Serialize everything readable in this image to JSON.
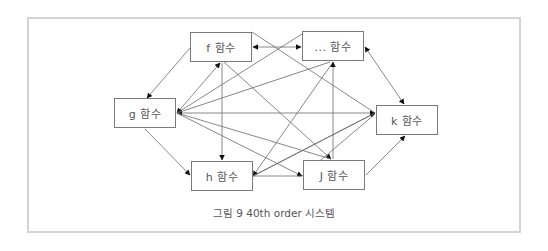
{
  "figure": {
    "caption": "그림 9 40th  order  시스템",
    "nodes": {
      "f": {
        "label": "f  함수"
      },
      "dots": {
        "label": "...  함수"
      },
      "g": {
        "label": "g  함수"
      },
      "k": {
        "label": "k  함수"
      },
      "h": {
        "label": "h  함수"
      },
      "j": {
        "label": "J  함수"
      }
    },
    "edges": [
      {
        "from": "f",
        "to": "g"
      },
      {
        "from": "g",
        "to": "f"
      },
      {
        "from": "g",
        "to": "h"
      },
      {
        "from": "f",
        "to": "h",
        "bidirectional": true
      },
      {
        "from": "dots",
        "to": "f",
        "bidirectional": true
      },
      {
        "from": "dots",
        "to": "k",
        "bidirectional": true
      },
      {
        "from": "j",
        "to": "dots",
        "bidirectional": true
      },
      {
        "from": "j",
        "to": "k"
      },
      {
        "from": "k",
        "to": "g",
        "bidirectional": true
      },
      {
        "from": "f",
        "to": "k"
      },
      {
        "from": "f",
        "to": "j"
      },
      {
        "from": "dots",
        "to": "g"
      },
      {
        "from": "dots",
        "to": "h"
      },
      {
        "from": "g",
        "to": "j"
      },
      {
        "from": "h",
        "to": "k"
      },
      {
        "from": "k",
        "to": "h"
      },
      {
        "from": "j",
        "to": "g"
      },
      {
        "from": "h",
        "to": "j"
      }
    ],
    "colors": {
      "frame": "#d4d4d4",
      "box": "#7a7a7a",
      "line": "#6a6a6a",
      "arrow": "#111111",
      "text": "#555555"
    }
  }
}
